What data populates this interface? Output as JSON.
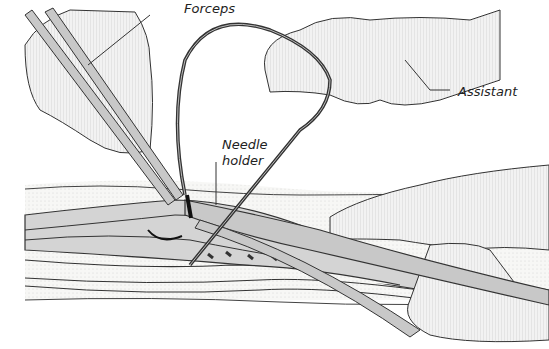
{
  "figure": {
    "colors": {
      "line": "#333333",
      "instrument_fill": "#c8c8c8",
      "skin_fill": "#efefef",
      "tissue_fill": "#f4f4f0",
      "vessel_fill": "#cfcfcf",
      "thread": "#444444"
    }
  },
  "labels": {
    "forceps": "Forceps",
    "assistant": "Assistant",
    "needle_holder_line1": "Needle",
    "needle_holder_line2": "holder"
  }
}
